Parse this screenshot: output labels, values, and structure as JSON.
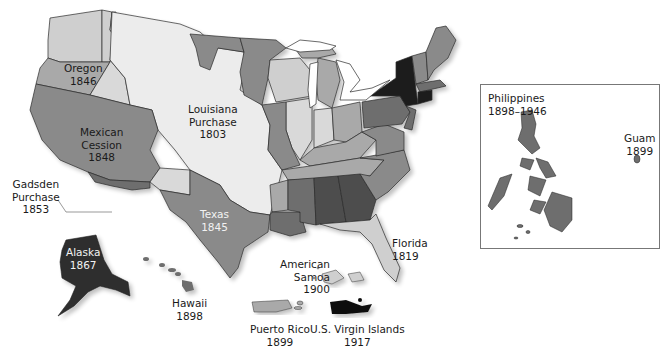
{
  "map": {
    "title_cropped": "…Acquisitions",
    "colors": {
      "lightest": "#ececec",
      "light": "#cfcfcf",
      "medium_light": "#a9a9a9",
      "medium": "#8a8a8a",
      "medium_dark": "#6e6e6e",
      "dark": "#4d4d4d",
      "darkest": "#1c1c1c",
      "border": "#2b2b2b",
      "water": "#ffffff"
    },
    "territories": [
      {
        "name": "Oregon",
        "year": "1846"
      },
      {
        "name": "Louisiana Purchase",
        "year": "1803"
      },
      {
        "name": "Mexican Cession",
        "year": "1848"
      },
      {
        "name": "Gadsden Purchase",
        "year": "1853"
      },
      {
        "name": "Texas",
        "year": "1845"
      },
      {
        "name": "Florida",
        "year": "1819"
      },
      {
        "name": "Alaska",
        "year": "1867"
      },
      {
        "name": "Hawaii",
        "year": "1898"
      },
      {
        "name": "American Samoa",
        "year": "1900"
      },
      {
        "name": "Puerto Rico",
        "year": "1899"
      },
      {
        "name": "U.S. Virgin Islands",
        "year": "1917"
      },
      {
        "name": "Philippines",
        "year": "1898–1946"
      },
      {
        "name": "Guam",
        "year": "1899"
      }
    ],
    "labels": {
      "oregon": [
        "Oregon",
        "1846"
      ],
      "louisiana": [
        "Louisiana",
        "Purchase",
        "1803"
      ],
      "mexican": [
        "Mexican",
        "Cession",
        "1848"
      ],
      "gadsden": [
        "Gadsden",
        "Purchase",
        "1853"
      ],
      "texas": [
        "Texas",
        "1845"
      ],
      "florida": [
        "Florida",
        "1819"
      ],
      "alaska": [
        "Alaska",
        "1867"
      ],
      "hawaii": [
        "Hawaii",
        "1898"
      ],
      "samoa": [
        "American",
        "Samoa",
        "1900"
      ],
      "puerto_rico": [
        "Puerto Rico",
        "1899"
      ],
      "virgin_islands": [
        "U.S. Virgin Islands",
        "1917"
      ],
      "philippines": [
        "Philippines",
        "1898–1946"
      ],
      "guam": [
        "Guam",
        "1899"
      ]
    }
  }
}
